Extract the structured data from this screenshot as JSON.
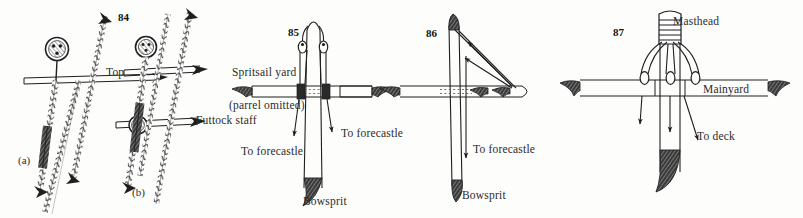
{
  "page": {
    "background_color": "#fdfdfc",
    "ink_color": "#1f1f1f",
    "width": 803,
    "height": 218
  },
  "figures": [
    {
      "number": "84",
      "number_pos": {
        "x": 118,
        "y": 12
      },
      "subfigures": [
        {
          "label": "(a)",
          "x": 18,
          "y": 155
        },
        {
          "label": "(b)",
          "x": 132,
          "y": 187
        }
      ],
      "labels": [
        {
          "text": "Top",
          "x": 106,
          "y": 67
        },
        {
          "text": "Futtock staff",
          "x": 196,
          "y": 115
        }
      ]
    },
    {
      "number": "85",
      "number_pos": {
        "x": 288,
        "y": 27
      },
      "labels": [
        {
          "text": "Spritsail yard",
          "x": 232,
          "y": 67
        },
        {
          "text": "(parrel omitted)",
          "x": 229,
          "y": 100
        },
        {
          "text": "To forecastle",
          "x": 241,
          "y": 146
        },
        {
          "text": "To forecastle",
          "x": 341,
          "y": 128
        },
        {
          "text": "Bowsprit",
          "x": 303,
          "y": 196
        }
      ]
    },
    {
      "number": "86",
      "number_pos": {
        "x": 426,
        "y": 28
      },
      "labels": [
        {
          "text": "To forecastle",
          "x": 473,
          "y": 144
        },
        {
          "text": "Bowsprit",
          "x": 462,
          "y": 190
        }
      ]
    },
    {
      "number": "87",
      "number_pos": {
        "x": 613,
        "y": 27
      },
      "labels": [
        {
          "text": "Masthead",
          "x": 673,
          "y": 16
        },
        {
          "text": "Mainyard",
          "x": 703,
          "y": 84
        },
        {
          "text": "To deck",
          "x": 697,
          "y": 131
        }
      ]
    }
  ],
  "icons": {
    "arrow": "arrow-head-icon",
    "yard_tip": "tapered-yard-tip-icon",
    "rope": "twisted-rope-icon",
    "mast_cap": "masthead-woolding-icon"
  }
}
